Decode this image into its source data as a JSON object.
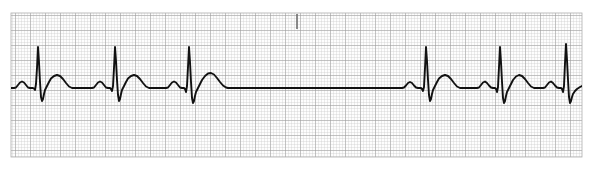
{
  "document": {
    "title": "ECG Rhythm Strip",
    "type": "electrocardiogram-rhythm-strip",
    "width_px": 592,
    "height_px": 170
  },
  "paper": {
    "background_color": "#ffffff",
    "paper_color": "#fdfdfd",
    "minor_grid_color": "#c9c9c9",
    "major_grid_color": "#9a9a9a",
    "trace_color": "#111111",
    "minor_grid_px": 3,
    "major_grid_px": 15,
    "grid_left_px": 11,
    "grid_top_px": 13,
    "grid_right_px": 582,
    "grid_bottom_px": 157,
    "trace_width_px": 1.9
  },
  "marker": {
    "name": "event-tick-mark",
    "x_px": 297,
    "y_top_px": 14,
    "y_bottom_px": 29,
    "color": "#6e6e6e",
    "width_px": 1.6
  },
  "chart_data": {
    "type": "line",
    "subtitle": "Sinus rhythm with a sinus pause",
    "xlabel": "Time",
    "ylabel": "Amplitude",
    "grid": true,
    "legend_position": "none",
    "baseline_y_px": 88,
    "xlim_px": [
      11,
      582
    ],
    "ylim_px": [
      13,
      157
    ],
    "paper_speed": "25 mm/s",
    "gain": "10 mm/mV",
    "rhythm_interpretation": "Normal sinus rhythm interrupted by a long pause (sinus arrest / sinus pause)",
    "beats": [
      {
        "index": 1,
        "p_center_px": 22,
        "r_peak_px": 38,
        "t_center_px": 57,
        "r_peak_y_px": 47,
        "s_trough_y_px": 101,
        "p_amp_px": 7,
        "t_amp_px": 13
      },
      {
        "index": 2,
        "p_center_px": 98,
        "r_peak_px": 114,
        "t_center_px": 133,
        "r_peak_y_px": 47,
        "s_trough_y_px": 101,
        "p_amp_px": 7,
        "t_amp_px": 13
      },
      {
        "index": 3,
        "p_center_px": 172,
        "r_peak_px": 188,
        "t_center_px": 209,
        "r_peak_y_px": 47,
        "s_trough_y_px": 103,
        "p_amp_px": 7,
        "t_amp_px": 15
      },
      {
        "index": 4,
        "p_center_px": 410,
        "r_peak_px": 426,
        "t_center_px": 445,
        "r_peak_y_px": 47,
        "s_trough_y_px": 101,
        "p_amp_px": 7,
        "t_amp_px": 13
      },
      {
        "index": 5,
        "p_center_px": 483,
        "r_peak_px": 499,
        "t_center_px": 518,
        "r_peak_y_px": 47,
        "s_trough_y_px": 103,
        "p_amp_px": 7,
        "t_amp_px": 13
      },
      {
        "index": 6,
        "p_center_px": 549,
        "r_peak_px": 565,
        "t_center_px": 584,
        "r_peak_y_px": 44,
        "s_trough_y_px": 103,
        "p_amp_px": 7,
        "t_amp_px": 13
      }
    ],
    "rr_intervals_px": [
      76,
      74,
      238,
      73,
      66
    ],
    "pause": {
      "present": true,
      "start_px": 228,
      "end_px": 408,
      "duration_px": 180,
      "description": "Long isoelectric pause between beat 3 and beat 4"
    },
    "series": [
      {
        "name": "Lead II",
        "points": [
          [
            11,
            88
          ],
          [
            14,
            88
          ],
          [
            16,
            87.5
          ],
          [
            18,
            85
          ],
          [
            20,
            82.5
          ],
          [
            22,
            81.5
          ],
          [
            24,
            82.5
          ],
          [
            26,
            85
          ],
          [
            28,
            87.5
          ],
          [
            30,
            88
          ],
          [
            33,
            88
          ],
          [
            34,
            88.5
          ],
          [
            35,
            90
          ],
          [
            36,
            84
          ],
          [
            37,
            68
          ],
          [
            38,
            47
          ],
          [
            39,
            62
          ],
          [
            40,
            82
          ],
          [
            41,
            97
          ],
          [
            42,
            101
          ],
          [
            43,
            99
          ],
          [
            44,
            94
          ],
          [
            45,
            90
          ],
          [
            47,
            86
          ],
          [
            49,
            82
          ],
          [
            51,
            78.5
          ],
          [
            54,
            76
          ],
          [
            57,
            75
          ],
          [
            60,
            76
          ],
          [
            63,
            79
          ],
          [
            66,
            83
          ],
          [
            69,
            86.5
          ],
          [
            72,
            88
          ],
          [
            76,
            88
          ],
          [
            86,
            88
          ],
          [
            92,
            88
          ],
          [
            94,
            87.5
          ],
          [
            96,
            85
          ],
          [
            98,
            82.5
          ],
          [
            100,
            81.5
          ],
          [
            102,
            82.5
          ],
          [
            104,
            85
          ],
          [
            106,
            87.5
          ],
          [
            108,
            88
          ],
          [
            110,
            88
          ],
          [
            111,
            89
          ],
          [
            112,
            91
          ],
          [
            113,
            86
          ],
          [
            114,
            68
          ],
          [
            115,
            47
          ],
          [
            116,
            61
          ],
          [
            117,
            80
          ],
          [
            118,
            95
          ],
          [
            119,
            101
          ],
          [
            120,
            99
          ],
          [
            121,
            94
          ],
          [
            122,
            90
          ],
          [
            124,
            86
          ],
          [
            126,
            82
          ],
          [
            128,
            78.5
          ],
          [
            131,
            76
          ],
          [
            134,
            75
          ],
          [
            137,
            76
          ],
          [
            140,
            79
          ],
          [
            143,
            83
          ],
          [
            146,
            86.5
          ],
          [
            149,
            88
          ],
          [
            154,
            88
          ],
          [
            162,
            88
          ],
          [
            166,
            88
          ],
          [
            168,
            87.5
          ],
          [
            170,
            85
          ],
          [
            172,
            82.5
          ],
          [
            174,
            81.5
          ],
          [
            176,
            82.5
          ],
          [
            178,
            85
          ],
          [
            180,
            87.5
          ],
          [
            182,
            88
          ],
          [
            184,
            88
          ],
          [
            185,
            89
          ],
          [
            186,
            92
          ],
          [
            187,
            86
          ],
          [
            188,
            67
          ],
          [
            189,
            47
          ],
          [
            190,
            62
          ],
          [
            191,
            82
          ],
          [
            192,
            98
          ],
          [
            193,
            103
          ],
          [
            194,
            101
          ],
          [
            195,
            96
          ],
          [
            196,
            92
          ],
          [
            198,
            88
          ],
          [
            200,
            84
          ],
          [
            202,
            80
          ],
          [
            205,
            76
          ],
          [
            208,
            73.5
          ],
          [
            211,
            73
          ],
          [
            214,
            74.5
          ],
          [
            217,
            78
          ],
          [
            220,
            82
          ],
          [
            223,
            85.5
          ],
          [
            226,
            87.5
          ],
          [
            228,
            88
          ],
          [
            240,
            88
          ],
          [
            260,
            88
          ],
          [
            280,
            88
          ],
          [
            300,
            88
          ],
          [
            320,
            88
          ],
          [
            340,
            88
          ],
          [
            360,
            88
          ],
          [
            380,
            88
          ],
          [
            395,
            88
          ],
          [
            402,
            88
          ],
          [
            404,
            87.5
          ],
          [
            406,
            85.5
          ],
          [
            408,
            83
          ],
          [
            410,
            82
          ],
          [
            412,
            83
          ],
          [
            414,
            85.5
          ],
          [
            416,
            87.5
          ],
          [
            418,
            88
          ],
          [
            421,
            88
          ],
          [
            422,
            89
          ],
          [
            423,
            91
          ],
          [
            424,
            87
          ],
          [
            425,
            68
          ],
          [
            426,
            47
          ],
          [
            427,
            61
          ],
          [
            428,
            80
          ],
          [
            429,
            95
          ],
          [
            430,
            101
          ],
          [
            431,
            99
          ],
          [
            432,
            94
          ],
          [
            433,
            90
          ],
          [
            435,
            86
          ],
          [
            437,
            82
          ],
          [
            439,
            78.5
          ],
          [
            442,
            76
          ],
          [
            445,
            75
          ],
          [
            448,
            76
          ],
          [
            451,
            79
          ],
          [
            454,
            83
          ],
          [
            457,
            86.5
          ],
          [
            460,
            88
          ],
          [
            465,
            88
          ],
          [
            474,
            88
          ],
          [
            477,
            88
          ],
          [
            479,
            87.5
          ],
          [
            481,
            85
          ],
          [
            483,
            82.5
          ],
          [
            485,
            81.5
          ],
          [
            487,
            83
          ],
          [
            489,
            85.5
          ],
          [
            491,
            87.5
          ],
          [
            493,
            88
          ],
          [
            495,
            88
          ],
          [
            496,
            89
          ],
          [
            497,
            92
          ],
          [
            498,
            87
          ],
          [
            499,
            67
          ],
          [
            500,
            47
          ],
          [
            501,
            62
          ],
          [
            502,
            82
          ],
          [
            503,
            98
          ],
          [
            504,
            103
          ],
          [
            505,
            101
          ],
          [
            506,
            96
          ],
          [
            507,
            92
          ],
          [
            509,
            88
          ],
          [
            511,
            84
          ],
          [
            513,
            80
          ],
          [
            516,
            76.5
          ],
          [
            519,
            75
          ],
          [
            522,
            76
          ],
          [
            525,
            79
          ],
          [
            528,
            83
          ],
          [
            531,
            86.5
          ],
          [
            534,
            88
          ],
          [
            538,
            88
          ],
          [
            543,
            88
          ],
          [
            545,
            87.5
          ],
          [
            547,
            85
          ],
          [
            549,
            82.5
          ],
          [
            551,
            81.5
          ],
          [
            553,
            83
          ],
          [
            555,
            85.5
          ],
          [
            557,
            87.5
          ],
          [
            559,
            88
          ],
          [
            561,
            88
          ],
          [
            562,
            89
          ],
          [
            563,
            92
          ],
          [
            564,
            86
          ],
          [
            565,
            63
          ],
          [
            566,
            44
          ],
          [
            567,
            60
          ],
          [
            568,
            80
          ],
          [
            569,
            97
          ],
          [
            570,
            103
          ],
          [
            571,
            101
          ],
          [
            572,
            97
          ],
          [
            573,
            94
          ],
          [
            575,
            91
          ],
          [
            577,
            89
          ],
          [
            580,
            87
          ],
          [
            583,
            85.5
          ],
          [
            586,
            84
          ],
          [
            590,
            83
          ]
        ]
      }
    ]
  }
}
